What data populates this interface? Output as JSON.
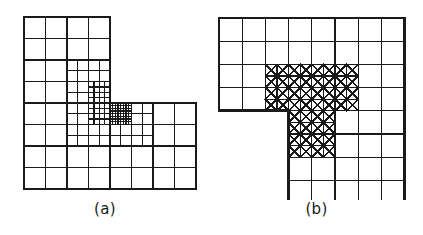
{
  "figure": {
    "panels": [
      {
        "id": "a",
        "caption": "(a)",
        "mesh_type": "quadtree-refined quadrilateral mesh",
        "domain": "L-shaped"
      },
      {
        "id": "b",
        "caption": "(b)",
        "mesh_type": "criss-cross triangulated refined mesh",
        "domain": "L-shaped"
      }
    ],
    "colors": {
      "background": "#ffffff",
      "line": "#1a1a1a",
      "caption": "#1a1a1a"
    }
  },
  "chart_data": {
    "type": "diagram",
    "title": "",
    "panels": [
      {
        "label": "(a)",
        "description": "L-shaped domain on an 8x8 base grid with the upper-right 4x4 block removed; successive quadtree refinement toward the re-entrant corner.",
        "base_grid": {
          "cols": 8,
          "rows": 8,
          "cell_px": 21.5
        },
        "origin_px": {
          "x": 24,
          "y": 17
        },
        "removed_block": {
          "col_start": 4,
          "col_end": 8,
          "row_start": 0,
          "row_end": 4
        },
        "reentrant_corner_cell": {
          "col": 4,
          "row": 4
        },
        "refinement_levels": 3,
        "refinement_regions": [
          {
            "level": 1,
            "col_start": 2,
            "col_end": 6,
            "row_start": 2,
            "row_end": 6
          },
          {
            "level": 2,
            "col_start": 3,
            "col_end": 5,
            "row_start": 3,
            "row_end": 5
          },
          {
            "level": 3,
            "col_start": 3.5,
            "col_end": 4.5,
            "row_start": 3.5,
            "row_end": 4.5
          }
        ]
      },
      {
        "label": "(b)",
        "description": "L-shaped domain on an 8x8 base grid with the lower-left 3x4 block removed; criss-cross (X-diagonal) triangulation in a refined band around the re-entrant corner.",
        "base_grid": {
          "cols": 8,
          "rows": 8,
          "cell_px": 23.2
        },
        "origin_px": {
          "x": 219,
          "y": 18
        },
        "removed_block": {
          "col_start": 0,
          "col_end": 3,
          "row_start": 4,
          "row_end": 8
        },
        "reentrant_corner_cell": {
          "col": 3,
          "row": 4
        },
        "triangulated_cells": [
          {
            "col": 2,
            "row": 2
          },
          {
            "col": 3,
            "row": 2
          },
          {
            "col": 4,
            "row": 2
          },
          {
            "col": 5,
            "row": 2
          },
          {
            "col": 2,
            "row": 3
          },
          {
            "col": 3,
            "row": 3
          },
          {
            "col": 4,
            "row": 3
          },
          {
            "col": 5,
            "row": 3
          },
          {
            "col": 3,
            "row": 4
          },
          {
            "col": 4,
            "row": 4
          },
          {
            "col": 3,
            "row": 5
          },
          {
            "col": 4,
            "row": 5
          }
        ]
      }
    ]
  }
}
